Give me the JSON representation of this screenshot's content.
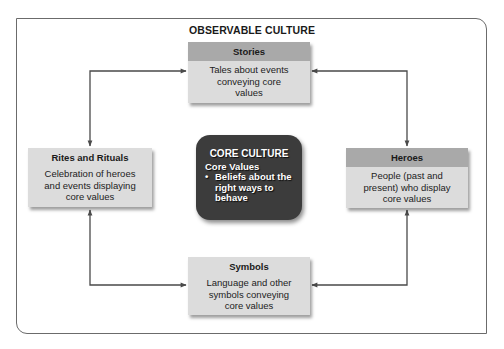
{
  "diagram": {
    "outer_title": "OBSERVABLE CULTURE",
    "core": {
      "title": "CORE CULTURE",
      "subtitle": "Core Values",
      "bullets": [
        "Beliefs about the right ways to behave"
      ],
      "bullet_lines": [
        "Beliefs about the",
        "right ways to",
        "behave"
      ],
      "bullet_glyph": "•"
    },
    "nodes": {
      "stories": {
        "title": "Stories",
        "description_lines": [
          "Tales about events",
          "conveying core",
          "values"
        ]
      },
      "rites": {
        "title": "Rites and Rituals",
        "description_lines": [
          "Celebration of heroes",
          "and events displaying",
          "core values"
        ]
      },
      "heroes": {
        "title": "Heroes",
        "description_lines": [
          "People (past and",
          "present) who display",
          "core values"
        ]
      },
      "symbols": {
        "title": "Symbols",
        "description_lines": [
          "Language and other",
          "symbols conveying",
          "core values"
        ]
      }
    },
    "connections": [
      {
        "from": "stories",
        "to": "rites",
        "bidirectional": true
      },
      {
        "from": "stories",
        "to": "heroes",
        "bidirectional": true
      },
      {
        "from": "rites",
        "to": "symbols",
        "bidirectional": true
      },
      {
        "from": "heroes",
        "to": "symbols",
        "bidirectional": true
      }
    ],
    "colors": {
      "box_fill": "#dcdcdc",
      "header_dark": "#a9a9a9",
      "core_fill": "#3c3c3c",
      "line": "#4a4a4a",
      "frame": "#6b6b6b"
    }
  }
}
